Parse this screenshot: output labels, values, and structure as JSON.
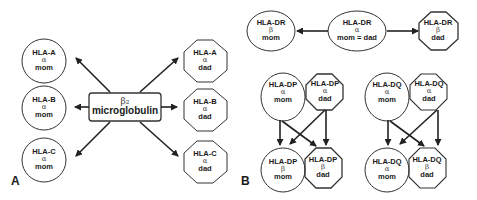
{
  "panels": {
    "A": {
      "letter": "A",
      "center": {
        "symbol": "β₂",
        "label": "microglobulin"
      },
      "mom": [
        {
          "name": "HLA-A",
          "chain": "α",
          "parent": "mom"
        },
        {
          "name": "HLA-B",
          "chain": "α",
          "parent": "mom"
        },
        {
          "name": "HLA-C",
          "chain": "α",
          "parent": "mom"
        }
      ],
      "dad": [
        {
          "name": "HLA-A",
          "chain": "α",
          "parent": "dad"
        },
        {
          "name": "HLA-B",
          "chain": "α",
          "parent": "dad"
        },
        {
          "name": "HLA-C",
          "chain": "α",
          "parent": "dad"
        }
      ]
    },
    "B": {
      "letter": "B",
      "dr": {
        "left": {
          "name": "HLA-DR",
          "chain": "β",
          "parent": "mom"
        },
        "center": {
          "name": "HLA-DR",
          "chain": "α",
          "parent": "mom = dad"
        },
        "right": {
          "name": "HLA-DR",
          "chain": "β",
          "parent": "dad"
        }
      },
      "dp": {
        "top_mom": {
          "name": "HLA-DP",
          "chain": "α",
          "parent": "mom"
        },
        "top_dad": {
          "name": "HLA-DP",
          "chain": "α",
          "parent": "dad"
        },
        "bot_mom": {
          "name": "HLA-DP",
          "chain": "β",
          "parent": "mom"
        },
        "bot_dad": {
          "name": "HLA-DP",
          "chain": "β",
          "parent": "dad"
        }
      },
      "dq": {
        "top_mom": {
          "name": "HLA-DQ",
          "chain": "α",
          "parent": "mom"
        },
        "top_dad": {
          "name": "HLA-DQ",
          "chain": "α",
          "parent": "dad"
        },
        "bot_mom": {
          "name": "HLA-DQ",
          "chain": "α",
          "parent": "mom"
        },
        "bot_dad": {
          "name": "HLA-DQ",
          "chain": "β",
          "parent": "dad"
        }
      }
    }
  },
  "colors": {
    "stroke": "#222222",
    "background": "#ffffff"
  }
}
